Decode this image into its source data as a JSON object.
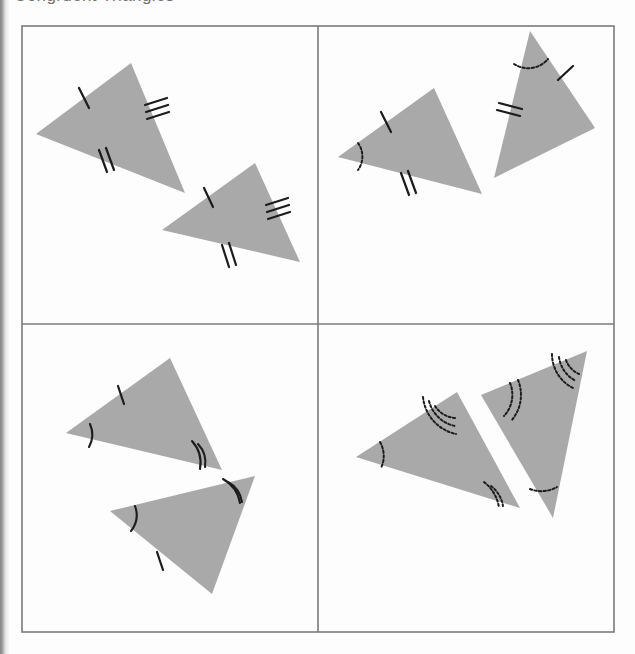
{
  "page": {
    "clipped_heading_text": "Congruent Triangles",
    "background_color": "#fdfdfd",
    "width": 635,
    "height": 654
  },
  "figure": {
    "frame": {
      "x": 22,
      "y": 26,
      "width": 592,
      "height": 606,
      "border_color": "#7b7b7b",
      "border_width": 1.6,
      "divider_x": 318,
      "divider_y": 324
    },
    "style": {
      "fill_color": "#a9a9a9",
      "mark_color": "#1c1c1c",
      "tick_width": 2.2,
      "arc_width": 2.0
    },
    "quadrants": [
      {
        "id": "top-left",
        "label": "Top-left panel",
        "criterion": "SSS",
        "mark_summary": "three pairs of congruent sides (1, 2 and 3 tick marks)",
        "triangles": [
          {
            "id": "tl-triangle-1",
            "points": "131,63 36,134 185,193",
            "side_ticks": [
              {
                "count": 1,
                "x": 84,
                "y": 94,
                "angle": -58,
                "len": 19
              },
              {
                "count": 2,
                "x": 105,
                "y": 153,
                "angle": -68,
                "len": 19
              },
              {
                "count": 3,
                "x": 162,
                "y": 122,
                "angle": -62,
                "len": 20
              }
            ],
            "angle_arcs": []
          },
          {
            "id": "tl-triangle-2",
            "points": "255,163 162,230 300,262"
          }
        ]
      },
      {
        "id": "top-right",
        "label": "Top-right panel",
        "criterion": "SAS",
        "mark_summary": "two pairs of congruent sides (1 and 2 ticks) with the included angle (single arc)",
        "triangles": [
          {
            "id": "tr-triangle-1",
            "points": "434,88 338,157 482,194"
          },
          {
            "id": "tr-triangle-2",
            "points": "530,31 494,178 595,128"
          }
        ]
      },
      {
        "id": "bottom-left",
        "label": "Bottom-left panel",
        "criterion": "ASA",
        "mark_summary": "two pairs of congruent angles (single and double arcs) with one pair of congruent sides (single tick)",
        "triangles": [
          {
            "id": "bl-triangle-1",
            "points": "170,358 66,433 222,470"
          },
          {
            "id": "bl-triangle-2",
            "points": "255,476 110,511 212,594"
          }
        ]
      },
      {
        "id": "bottom-right",
        "label": "Bottom-right panel",
        "criterion": "AAA",
        "mark_summary": "three pairs of congruent angles only (1, 2 and 3 dotted arcs) — not a congruence criterion",
        "triangles": [
          {
            "id": "br-triangle-1",
            "points": "457,392 356,457 520,508"
          },
          {
            "id": "br-triangle-2",
            "points": "587,351 481,395 553,518"
          }
        ]
      }
    ]
  }
}
